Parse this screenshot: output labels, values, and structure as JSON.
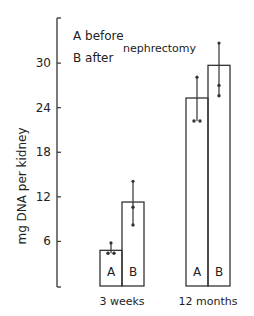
{
  "chart_data": {
    "type": "bar",
    "title": "",
    "xlabel": "",
    "ylabel": "mg DNA per kidney",
    "ylim": [
      0,
      35
    ],
    "yticks": [
      6,
      12,
      18,
      24,
      30
    ],
    "categories": [
      "3 weeks",
      "12 months"
    ],
    "series": [
      {
        "name": "A",
        "label": "before nephrectomy",
        "values": [
          4.8,
          25.3
        ],
        "error_upper": [
          5.8,
          28.1
        ],
        "points": [
          [
            4.4,
            4.4
          ],
          [
            22.2,
            22.2
          ]
        ]
      },
      {
        "name": "B",
        "label": "after nephrectomy",
        "values": [
          11.3,
          29.7
        ],
        "error_upper": [
          14.1,
          32.7
        ],
        "points": [
          [
            10.6,
            8.2
          ],
          [
            27.0,
            25.6
          ]
        ]
      }
    ],
    "legend": {
      "line1": "A  before",
      "line2": "B  after",
      "shared": "nephrectomy",
      "position": "top-left"
    },
    "grid": false,
    "bar_labels": [
      "A",
      "B",
      "A",
      "B"
    ]
  }
}
